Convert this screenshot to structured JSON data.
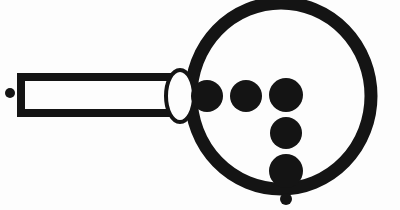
{
  "figure": {
    "title": "Magnifying glass with dots",
    "medium": "scanned bitmap line art",
    "canvas": {
      "width": 400,
      "height": 210
    },
    "colors": {
      "ink": "#141414",
      "paper": "#fdfdfd"
    }
  },
  "parts": {
    "left_dot": {
      "name": "left tail dot",
      "cx": 10,
      "cy": 93,
      "r": 5,
      "style": "filled"
    },
    "handle": {
      "name": "handle",
      "x": 21,
      "y": 77,
      "width": 152,
      "height": 36,
      "stroke_width": 8,
      "style": "outlined",
      "fill": "paper"
    },
    "collar": {
      "name": "collar oval",
      "cx": 180,
      "cy": 96,
      "rx": 14,
      "ry": 26,
      "stroke_width": 4,
      "style": "outlined",
      "fill": "paper"
    },
    "lens_ring": {
      "name": "lens ring",
      "cx": 281,
      "cy": 96,
      "rx": 90,
      "ry": 93,
      "stroke_width": 13,
      "style": "open ring",
      "fill": "none"
    }
  },
  "dots": [
    {
      "label": "row dot 1",
      "cx": 207,
      "cy": 96,
      "r": 16
    },
    {
      "label": "row dot 2",
      "cx": 246,
      "cy": 96,
      "r": 16
    },
    {
      "label": "row dot 3",
      "cx": 286,
      "cy": 95,
      "r": 17
    },
    {
      "label": "column dot 2",
      "cx": 286,
      "cy": 133,
      "r": 16
    },
    {
      "label": "column dot 3",
      "cx": 286,
      "cy": 171,
      "r": 17
    },
    {
      "label": "bottom outside dot",
      "cx": 286,
      "cy": 199,
      "r": 6
    }
  ],
  "counts": {
    "total_dots": 7,
    "dots_inside_lens": 5,
    "dots_outside_lens": 2,
    "top_row_dots": 3,
    "vertical_column_dots": 3
  }
}
